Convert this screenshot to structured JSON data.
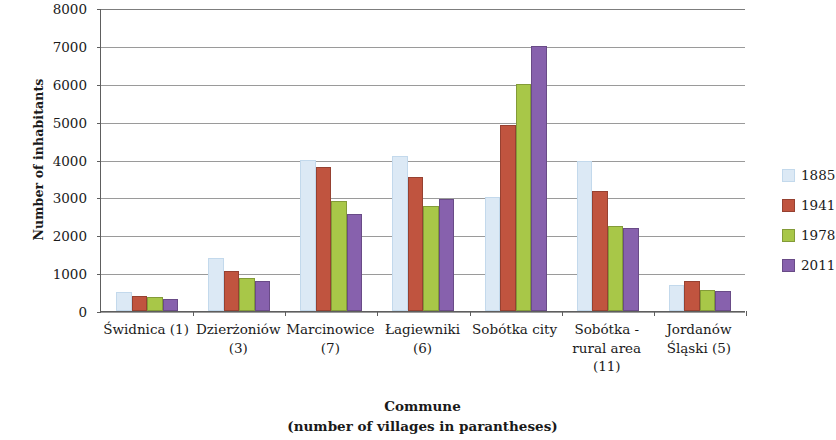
{
  "chart_data": {
    "type": "bar",
    "title": "",
    "xlabel": "Commune\n(number of villages in parantheses)",
    "ylabel": "Number of inhabitants",
    "ylim": [
      0,
      8000
    ],
    "ytick_step": 1000,
    "yticks": [
      "8000",
      "7000",
      "6000",
      "5000",
      "4000",
      "3000",
      "2000",
      "1000",
      "0"
    ],
    "grid": true,
    "legend_position": "right",
    "categories": [
      "Świdnica (1)",
      "Dzierżoniów\n(3)",
      "Marcinowice\n(7)",
      "Łagiewniki\n(6)",
      "Sobótka city",
      "Sobótka -\nrural area\n(11)",
      "Jordanów\nŚląski (5)"
    ],
    "series": [
      {
        "name": "1885",
        "color": "#dce9f5",
        "values": [
          490,
          1400,
          4000,
          4100,
          3000,
          3950,
          700
        ]
      },
      {
        "name": "1941",
        "color": "#c0543f",
        "values": [
          400,
          1050,
          3800,
          3550,
          4920,
          3180,
          800
        ]
      },
      {
        "name": "1978",
        "color": "#a8c748",
        "values": [
          380,
          870,
          2900,
          2760,
          6000,
          2250,
          560
        ]
      },
      {
        "name": "2011",
        "color": "#8761ad",
        "values": [
          330,
          780,
          2550,
          2960,
          7000,
          2180,
          520
        ]
      }
    ]
  },
  "legend": {
    "items": [
      {
        "label": "1885",
        "color": "#dce9f5"
      },
      {
        "label": "1941",
        "color": "#c0543f"
      },
      {
        "label": "1978",
        "color": "#a8c748"
      },
      {
        "label": "2011",
        "color": "#8761ad"
      }
    ]
  },
  "axis_titles": {
    "y": "Number of inhabitants",
    "x_line1": "Commune",
    "x_line2": "(number of villages in parantheses)"
  }
}
